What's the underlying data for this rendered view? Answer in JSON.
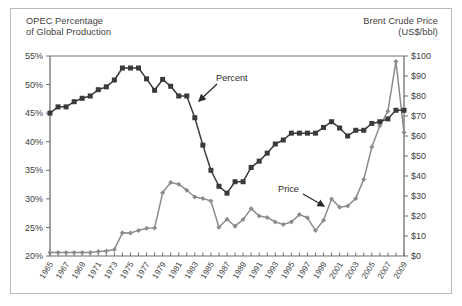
{
  "figure": {
    "left_axis_title": "OPEC Percentage\nof Global Production",
    "right_axis_title": "Brent Crude Price\n(US$/bbl)"
  },
  "annotations": {
    "percent_label": "Percent",
    "price_label": "Price"
  },
  "chart_data": {
    "type": "line",
    "title": "",
    "xlabel": "",
    "grid": false,
    "legend": "inline-annotations",
    "x": [
      1965,
      1966,
      1967,
      1968,
      1969,
      1970,
      1971,
      1972,
      1973,
      1974,
      1975,
      1976,
      1977,
      1978,
      1979,
      1980,
      1981,
      1982,
      1983,
      1984,
      1985,
      1986,
      1987,
      1988,
      1989,
      1990,
      1991,
      1992,
      1993,
      1994,
      1995,
      1996,
      1997,
      1998,
      1999,
      2000,
      2001,
      2002,
      2003,
      2004,
      2005,
      2006,
      2007,
      2008,
      2009
    ],
    "xlim": [
      1965,
      2009
    ],
    "xtick_labels": [
      "1965",
      "1967",
      "1969",
      "1971",
      "1973",
      "1975",
      "1977",
      "1979",
      "1981",
      "1983",
      "1985",
      "1987",
      "1989",
      "1991",
      "1993",
      "1995",
      "1997",
      "1999",
      "2001",
      "2003",
      "2005",
      "2007",
      "2009"
    ],
    "xtick_step_years": 2,
    "series": [
      {
        "name": "Percent",
        "axis": "left",
        "ylabel": "OPEC Percentage of Global Production",
        "ylim": [
          20,
          55
        ],
        "ytick_labels": [
          "20%",
          "25%",
          "30%",
          "35%",
          "40%",
          "45%",
          "50%",
          "55%"
        ],
        "ytick_values": [
          20,
          25,
          30,
          35,
          40,
          45,
          50,
          55
        ],
        "unit": "%",
        "color": "#3a3a3a",
        "marker": "square",
        "values": [
          45.0,
          46.1,
          46.1,
          47.0,
          47.6,
          48.0,
          49.1,
          49.6,
          50.8,
          52.9,
          52.9,
          52.9,
          51.0,
          49.0,
          50.9,
          49.7,
          48.0,
          48.0,
          44.2,
          39.4,
          35.0,
          32.2,
          31.0,
          33.0,
          33.0,
          35.5,
          36.6,
          38.0,
          39.6,
          40.3,
          41.5,
          41.5,
          41.5,
          41.5,
          42.5,
          43.5,
          42.4,
          41.0,
          42.0,
          42.0,
          43.2,
          43.5,
          44.0,
          45.5,
          45.5
        ]
      },
      {
        "name": "Price",
        "axis": "right",
        "ylabel": "Brent Crude Price (US$/bbl)",
        "ylim": [
          0,
          100
        ],
        "ytick_labels": [
          "$0",
          "$10",
          "$20",
          "$30",
          "$40",
          "$50",
          "$60",
          "$70",
          "$80",
          "$90",
          "$100"
        ],
        "ytick_values": [
          0,
          10,
          20,
          30,
          40,
          50,
          60,
          70,
          80,
          90,
          100
        ],
        "unit": "US$/bbl",
        "color": "#8c8c8c",
        "marker": "diamond",
        "values": [
          1.8,
          1.8,
          1.8,
          1.8,
          1.8,
          1.8,
          2.2,
          2.5,
          3.3,
          11.6,
          11.5,
          12.8,
          13.9,
          14.0,
          31.6,
          36.8,
          35.9,
          32.9,
          29.5,
          28.8,
          27.5,
          14.4,
          18.4,
          14.9,
          18.2,
          23.7,
          20.0,
          19.3,
          17.0,
          15.8,
          17.0,
          20.7,
          19.1,
          12.7,
          17.9,
          28.5,
          24.4,
          25.0,
          28.8,
          38.3,
          54.5,
          65.1,
          72.4,
          97.3,
          61.7
        ]
      }
    ]
  }
}
